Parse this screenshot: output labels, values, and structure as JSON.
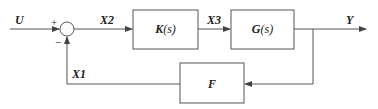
{
  "diagram": {
    "type": "feedback-control-block-diagram",
    "signals": {
      "input": "U",
      "error": "X2",
      "control": "X3",
      "output": "Y",
      "feedback": "X1"
    },
    "summing_junction": {
      "plus_sign": "+",
      "minus_sign": "−"
    },
    "blocks": {
      "controller": {
        "label_main": "K",
        "label_arg": "(s)"
      },
      "plant": {
        "label_main": "G",
        "label_arg": "(s)"
      },
      "feedback": {
        "label_main": "F"
      }
    },
    "colors": {
      "line": "#555555",
      "text": "#222222",
      "background": "#ffffff"
    }
  }
}
